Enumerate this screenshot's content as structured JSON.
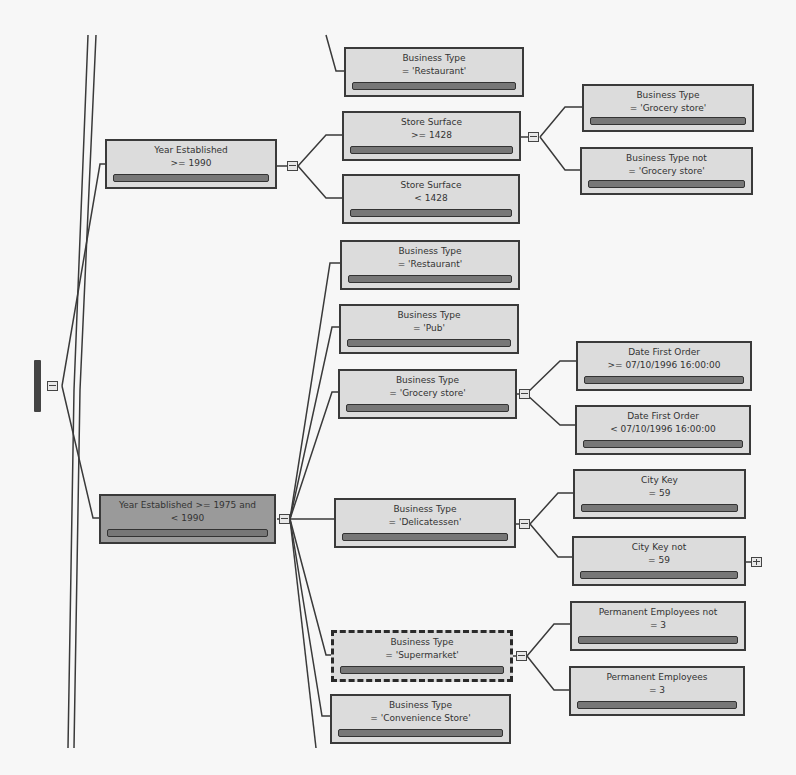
{
  "diagram": {
    "type": "decision-tree",
    "root": {
      "collapsed": false
    },
    "nodes": [
      {
        "id": "n1",
        "l1": "Business Type",
        "l2": "= 'Restaurant'"
      },
      {
        "id": "n2",
        "l1": "Year Established",
        "l2": ">= 1990"
      },
      {
        "id": "n3",
        "l1": "Store Surface",
        "l2": ">= 1428"
      },
      {
        "id": "n4",
        "l1": "Store Surface",
        "l2": "< 1428"
      },
      {
        "id": "n5",
        "l1": "Business Type",
        "l2": "= 'Grocery store'"
      },
      {
        "id": "n6",
        "l1": "Business Type not",
        "l2": "= 'Grocery store'"
      },
      {
        "id": "n7",
        "l1": "Business Type",
        "l2": "= 'Restaurant'"
      },
      {
        "id": "n8",
        "l1": "Business Type",
        "l2": "= 'Pub'"
      },
      {
        "id": "n9",
        "l1": "Business Type",
        "l2": "= 'Grocery store'"
      },
      {
        "id": "n10",
        "l1": "Date First Order",
        "l2": ">= 07/10/1996 16:00:00"
      },
      {
        "id": "n11",
        "l1": "Date First Order",
        "l2": "< 07/10/1996 16:00:00"
      },
      {
        "id": "n12",
        "l1": "Year Established >= 1975 and",
        "l2": "< 1990"
      },
      {
        "id": "n13",
        "l1": "Business Type",
        "l2": "= 'Delicatessen'"
      },
      {
        "id": "n14",
        "l1": "City Key",
        "l2": "= 59"
      },
      {
        "id": "n15",
        "l1": "City Key not",
        "l2": "= 59"
      },
      {
        "id": "n16",
        "l1": "Business Type",
        "l2": "= 'Supermarket'"
      },
      {
        "id": "n17",
        "l1": "Permanent Employees not",
        "l2": "= 3"
      },
      {
        "id": "n18",
        "l1": "Permanent Employees",
        "l2": "= 3"
      },
      {
        "id": "n19",
        "l1": "Business Type",
        "l2": "= 'Convenience Store'"
      }
    ],
    "selected_node": "n16",
    "highlighted_node": "n12",
    "icons": {
      "expanded": "collapse-minus-icon",
      "collapsed": "expand-plus-icon"
    }
  }
}
